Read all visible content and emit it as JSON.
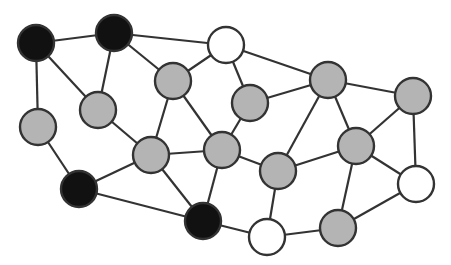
{
  "diagram": {
    "type": "graph",
    "colors": {
      "black": "#111111",
      "gray": "#b4b4b4",
      "white": "#ffffff",
      "stroke": "#333333"
    },
    "node_radius": 18,
    "nodes": [
      {
        "id": 1,
        "x": 36,
        "y": 43,
        "color": "black"
      },
      {
        "id": 2,
        "x": 114,
        "y": 33,
        "color": "black"
      },
      {
        "id": 3,
        "x": 226,
        "y": 45,
        "color": "white"
      },
      {
        "id": 4,
        "x": 173,
        "y": 81,
        "color": "gray"
      },
      {
        "id": 5,
        "x": 98,
        "y": 110,
        "color": "gray"
      },
      {
        "id": 6,
        "x": 38,
        "y": 127,
        "color": "gray"
      },
      {
        "id": 7,
        "x": 250,
        "y": 103,
        "color": "gray"
      },
      {
        "id": 8,
        "x": 328,
        "y": 80,
        "color": "gray"
      },
      {
        "id": 9,
        "x": 413,
        "y": 96,
        "color": "gray"
      },
      {
        "id": 10,
        "x": 151,
        "y": 155,
        "color": "gray"
      },
      {
        "id": 11,
        "x": 222,
        "y": 150,
        "color": "gray"
      },
      {
        "id": 12,
        "x": 278,
        "y": 171,
        "color": "gray"
      },
      {
        "id": 13,
        "x": 356,
        "y": 146,
        "color": "gray"
      },
      {
        "id": 14,
        "x": 79,
        "y": 189,
        "color": "black"
      },
      {
        "id": 15,
        "x": 203,
        "y": 221,
        "color": "black"
      },
      {
        "id": 16,
        "x": 267,
        "y": 237,
        "color": "white"
      },
      {
        "id": 17,
        "x": 338,
        "y": 228,
        "color": "gray"
      },
      {
        "id": 18,
        "x": 416,
        "y": 184,
        "color": "white"
      }
    ],
    "edges": [
      [
        1,
        2
      ],
      [
        1,
        5
      ],
      [
        1,
        6
      ],
      [
        2,
        3
      ],
      [
        2,
        5
      ],
      [
        2,
        4
      ],
      [
        3,
        4
      ],
      [
        3,
        7
      ],
      [
        3,
        8
      ],
      [
        4,
        10
      ],
      [
        4,
        11
      ],
      [
        5,
        10
      ],
      [
        6,
        14
      ],
      [
        7,
        8
      ],
      [
        7,
        11
      ],
      [
        8,
        12
      ],
      [
        8,
        13
      ],
      [
        8,
        9
      ],
      [
        9,
        13
      ],
      [
        9,
        18
      ],
      [
        10,
        11
      ],
      [
        10,
        14
      ],
      [
        10,
        15
      ],
      [
        11,
        12
      ],
      [
        11,
        15
      ],
      [
        12,
        13
      ],
      [
        12,
        16
      ],
      [
        13,
        17
      ],
      [
        13,
        18
      ],
      [
        14,
        15
      ],
      [
        15,
        16
      ],
      [
        16,
        17
      ],
      [
        17,
        18
      ]
    ]
  }
}
